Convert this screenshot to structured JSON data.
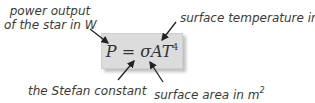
{
  "formula": {
    "lhs": "P",
    "equals": "=",
    "rhs_main": "σAT",
    "exponent": "4"
  },
  "annotations": {
    "power_line1": "power output",
    "power_line2": "of the star in W",
    "temperature": "surface temperature in K",
    "stefan": "the Stefan constant",
    "area_text": "surface area in m",
    "area_exp": "2"
  },
  "colors": {
    "box_fill": "#dcdcdc",
    "text": "#3a3a3a",
    "arrow": "#222222"
  }
}
